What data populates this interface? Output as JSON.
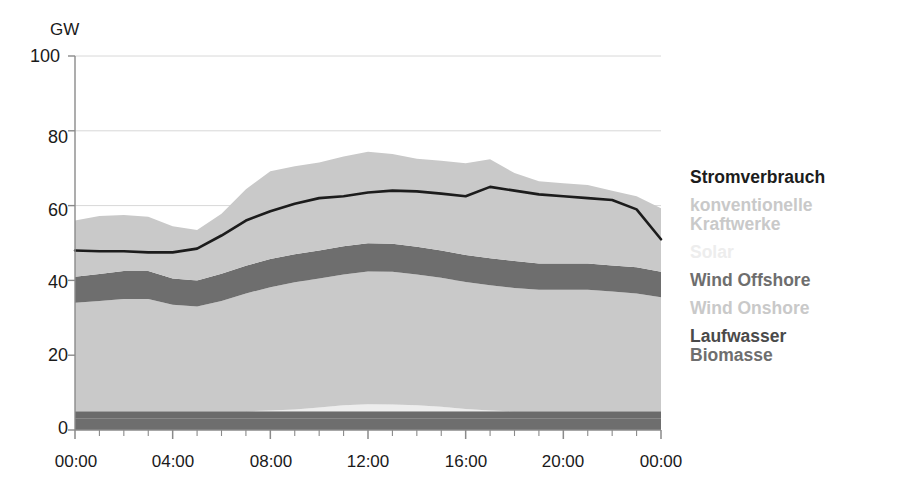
{
  "axes": {
    "y_unit_label": "GW",
    "y_ticks": [
      "0",
      "20",
      "40",
      "60",
      "80",
      "100"
    ],
    "x_ticks": [
      "00:00",
      "04:00",
      "08:00",
      "12:00",
      "16:00",
      "20:00",
      "00:00"
    ]
  },
  "legend": {
    "entries": [
      {
        "label": "Stromverbrauch",
        "color": "#1c1c1c"
      },
      {
        "label": "konventionelle",
        "color": "#c9c9c9"
      },
      {
        "label": "Kraftwerke",
        "color": "#c9c9c9"
      },
      {
        "label": "Solar",
        "color": "#ededed"
      },
      {
        "label": "Wind Offshore",
        "color": "#6e6e6e"
      },
      {
        "label": "Wind Onshore",
        "color": "#c9c9c9"
      },
      {
        "label": "Laufwasser",
        "color": "#4a4a4a"
      },
      {
        "label": "Biomasse",
        "color": "#6e6e6e"
      }
    ]
  },
  "colors": {
    "conventional": "#c9c9c9",
    "solar": "#ededed",
    "wind_offshore": "#6e6e6e",
    "wind_onshore": "#c9c9c9",
    "laufwasser": "#6b6b6b",
    "biomasse": "#6e6e6e",
    "consumption_line": "#1c1c1c",
    "gridline": "#d8d8d8",
    "axis": "#8a8a8a"
  },
  "chart_data": {
    "type": "area",
    "title": "",
    "subtitle": "",
    "xlabel": "",
    "ylabel": "GW",
    "ylim": [
      0,
      100
    ],
    "grid": true,
    "legend_position": "right",
    "x": [
      "00:00",
      "01:00",
      "02:00",
      "03:00",
      "04:00",
      "05:00",
      "06:00",
      "07:00",
      "08:00",
      "09:00",
      "10:00",
      "11:00",
      "12:00",
      "13:00",
      "14:00",
      "15:00",
      "16:00",
      "17:00",
      "18:00",
      "19:00",
      "20:00",
      "21:00",
      "22:00",
      "23:00",
      "24:00"
    ],
    "x_hours": [
      0,
      1,
      2,
      3,
      4,
      5,
      6,
      7,
      8,
      9,
      10,
      11,
      12,
      13,
      14,
      15,
      16,
      17,
      18,
      19,
      20,
      21,
      22,
      23,
      24
    ],
    "stack_order_bottom_to_top": [
      "Biomasse",
      "Laufwasser",
      "Solar",
      "Wind Onshore",
      "Wind Offshore",
      "konventionelle Kraftwerke"
    ],
    "series": [
      {
        "name": "Biomasse",
        "values": [
          3,
          3,
          3,
          3,
          3,
          3,
          3,
          3,
          3,
          3,
          3,
          3,
          3,
          3,
          3,
          3,
          3,
          3,
          3,
          3,
          3,
          3,
          3,
          3,
          3
        ]
      },
      {
        "name": "Laufwasser",
        "values": [
          2,
          2,
          2,
          2,
          2,
          2,
          2,
          2,
          2,
          2,
          2,
          2,
          2,
          2,
          2,
          2,
          2,
          2,
          2,
          2,
          2,
          2,
          2,
          2,
          2
        ]
      },
      {
        "name": "Solar",
        "values": [
          0,
          0,
          0,
          0,
          0,
          0,
          0,
          0,
          0.2,
          0.5,
          1.0,
          1.6,
          1.9,
          1.8,
          1.6,
          1.2,
          0.6,
          0.2,
          0,
          0,
          0,
          0,
          0,
          0,
          0
        ]
      },
      {
        "name": "Wind Onshore",
        "values": [
          29,
          29.5,
          30,
          30,
          28.5,
          28,
          29.5,
          31.5,
          33,
          34,
          34.5,
          35,
          35.5,
          35.5,
          35,
          34.5,
          34,
          33.5,
          33,
          32.5,
          32.5,
          32.5,
          32,
          31.5,
          30.5
        ]
      },
      {
        "name": "Wind Offshore",
        "values": [
          7,
          7.2,
          7.5,
          7.5,
          7,
          7,
          7.3,
          7.4,
          7.5,
          7.5,
          7.5,
          7.5,
          7.5,
          7.5,
          7.4,
          7.3,
          7.2,
          7.2,
          7.2,
          7,
          7,
          7,
          7,
          7,
          6.8
        ]
      },
      {
        "name": "konventionelle Kraftwerke",
        "values": [
          15,
          15.5,
          15,
          14.5,
          14,
          13.5,
          16,
          20.5,
          23.5,
          23.5,
          23.5,
          24,
          24.5,
          24,
          23.5,
          24,
          24.5,
          26.5,
          23.5,
          22,
          21.5,
          21,
          20,
          19,
          17
        ]
      }
    ],
    "stack_totals": [
      56,
      57.2,
      57.5,
      57,
      54.5,
      53.5,
      57.8,
      62.8,
      69.2,
      70.5,
      72,
      75.1,
      76.4,
      75.8,
      74.5,
      74,
      72.3,
      77.4,
      73.7,
      71.5,
      71,
      70.5,
      69,
      67.5,
      62.3
    ],
    "consumption_line": {
      "name": "Stromverbrauch",
      "values": [
        48,
        47.8,
        47.8,
        47.5,
        47.5,
        48.5,
        52,
        56,
        58.5,
        60.5,
        62,
        62.5,
        63.5,
        64,
        63.8,
        63.2,
        62.5,
        65,
        64,
        63,
        62.5,
        62,
        61.5,
        59,
        51
      ]
    },
    "annotations": []
  }
}
